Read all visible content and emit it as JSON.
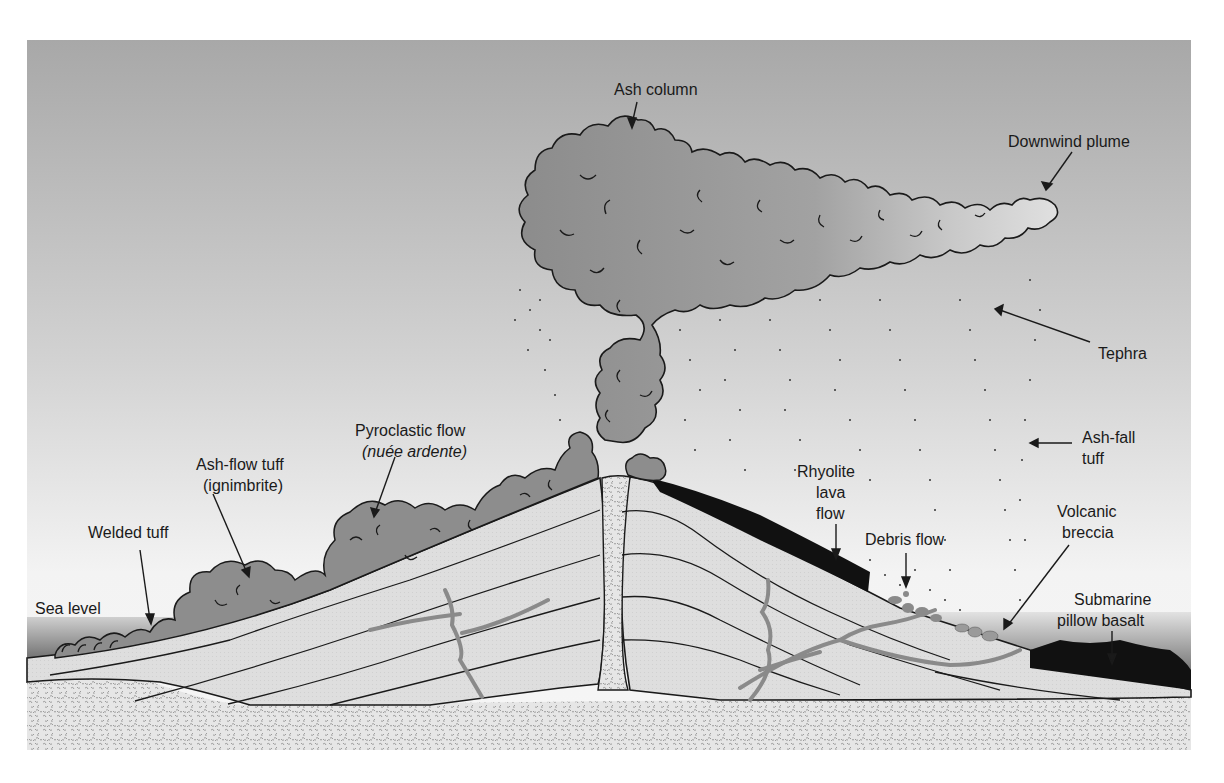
{
  "diagram": {
    "colors": {
      "sky_top": "#a9a9a9",
      "sky_bottom": "#f4f4f4",
      "ash_cloud": "#8f8f8f",
      "ash_cloud_light": "#c9c9c9",
      "strata": "#dcdcdc",
      "basement": "#e4e4e4",
      "basement_speckle": "#9a9a9a",
      "lava": "#111111",
      "dike": "#8a8a8a",
      "sea": "#7a7a7a",
      "outline": "#1a1a1a"
    },
    "labels": {
      "ash_column": "Ash column",
      "downwind_plume": "Downwind plume",
      "tephra": "Tephra",
      "pyroclastic_flow_1": "Pyroclastic flow",
      "pyroclastic_flow_2": "(nuée ardente)",
      "ash_flow_tuff_1": "Ash-flow tuff",
      "ash_flow_tuff_2": "(ignimbrite)",
      "welded_tuff": "Welded tuff",
      "sea_level": "Sea level",
      "rhyolite_1": "Rhyolite",
      "rhyolite_2": "lava",
      "rhyolite_3": "flow",
      "debris_flow": "Debris flow",
      "ash_fall_tuff_1": "Ash-fall",
      "ash_fall_tuff_2": "tuff",
      "volcanic_breccia_1": "Volcanic",
      "volcanic_breccia_2": "breccia",
      "submarine_basalt_1": "Submarine",
      "submarine_basalt_2": "pillow basalt"
    }
  }
}
